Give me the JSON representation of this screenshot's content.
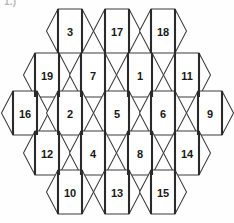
{
  "page": {
    "label": "1.)",
    "width": 234,
    "height": 223,
    "background_color": "#fefefe"
  },
  "colors": {
    "hex_fill": "#ffffff",
    "hex_stroke": "#3b3b3b",
    "hex_stroke_bold": "#2a2a2a",
    "number_color": "#181818",
    "label_color": "#b9b9b9"
  },
  "geometry": {
    "hex_half_width": 23.5,
    "hex_half_height": 22,
    "hex_corner_inset": 11.5,
    "column_pitch": 46.5,
    "row_pitch": 35
  },
  "grid": {
    "shape": "hexagonal-honeycomb",
    "orientation": "flat-top",
    "cell_count": 19,
    "rows": [
      {
        "row_index": 0,
        "center_y": 31,
        "cells": [
          {
            "value": "3",
            "cx": 70
          },
          {
            "value": "17",
            "cx": 117
          },
          {
            "value": "18",
            "cx": 163
          }
        ]
      },
      {
        "row_index": 1,
        "center_y": 75,
        "cells": [
          {
            "value": "19",
            "cx": 47
          },
          {
            "value": "7",
            "cx": 93
          },
          {
            "value": "1",
            "cx": 140
          },
          {
            "value": "11",
            "cx": 187
          }
        ]
      },
      {
        "row_index": 2,
        "center_y": 113,
        "cells": [
          {
            "value": "16",
            "cx": 25
          },
          {
            "value": "2",
            "cx": 70
          },
          {
            "value": "5",
            "cx": 117
          },
          {
            "value": "6",
            "cx": 163
          },
          {
            "value": "9",
            "cx": 210
          }
        ]
      },
      {
        "row_index": 3,
        "center_y": 153,
        "cells": [
          {
            "value": "12",
            "cx": 47
          },
          {
            "value": "4",
            "cx": 93
          },
          {
            "value": "8",
            "cx": 140
          },
          {
            "value": "14",
            "cx": 187
          }
        ]
      },
      {
        "row_index": 4,
        "center_y": 192,
        "cells": [
          {
            "value": "10",
            "cx": 70
          },
          {
            "value": "13",
            "cx": 117
          },
          {
            "value": "15",
            "cx": 163
          }
        ]
      }
    ]
  }
}
